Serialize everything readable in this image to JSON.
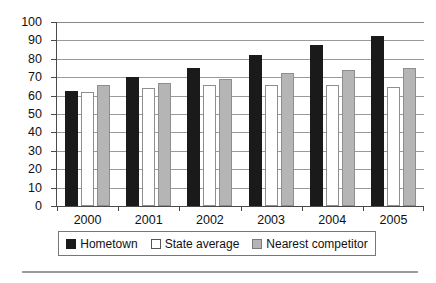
{
  "chart_data": {
    "type": "bar",
    "title": "",
    "subtitle": "",
    "xlabel": "",
    "ylabel": "",
    "categories": [
      "2000",
      "2001",
      "2002",
      "2003",
      "2004",
      "2005"
    ],
    "series": [
      {
        "name": "Hometown",
        "color": "#1a1a1a",
        "values": [
          62.5,
          70,
          75,
          82,
          87.5,
          92.5
        ]
      },
      {
        "name": "State average",
        "color": "#ffffff",
        "values": [
          62,
          64,
          66,
          65.5,
          66,
          64.5
        ]
      },
      {
        "name": "Nearest competitor",
        "color": "#b5b5b5",
        "values": [
          66,
          67,
          69,
          72.5,
          74,
          75
        ]
      }
    ],
    "ylim": [
      0,
      100
    ],
    "ytick_step": 10,
    "yticks": [
      "100",
      "90",
      "80",
      "70",
      "60",
      "50",
      "40",
      "30",
      "20",
      "10",
      "0"
    ],
    "grid": true,
    "legend_position": "bottom"
  },
  "legend": {
    "items": [
      {
        "label": "Hometown"
      },
      {
        "label": "State average"
      },
      {
        "label": "Nearest competitor"
      }
    ]
  }
}
